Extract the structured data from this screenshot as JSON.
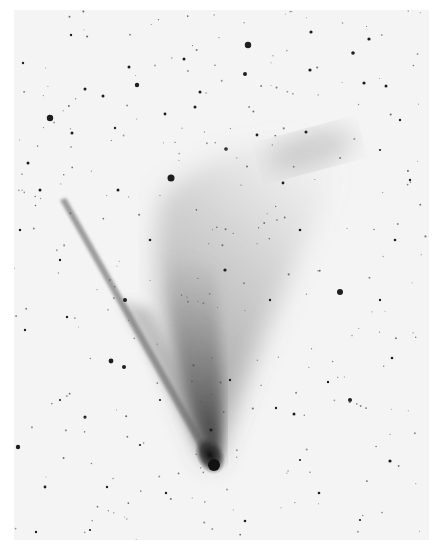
{
  "image": {
    "subject": "comet",
    "rendering": "negative photographic print (dark on light)",
    "colors": {
      "background": "#f4f4f4",
      "margin": "#ffffff",
      "nucleus": "#1a1a1a",
      "tail": "#6a6a6a",
      "stars": "#1e1e1e"
    },
    "nucleus": {
      "x": 202,
      "y": 457
    },
    "stars": [
      [
        248,
        45,
        3.2
      ],
      [
        50,
        118,
        3.2
      ],
      [
        171,
        178,
        3.5
      ],
      [
        340,
        292,
        3
      ],
      [
        125,
        300,
        2
      ],
      [
        184,
        59,
        1.5
      ],
      [
        245,
        74,
        2
      ],
      [
        129,
        67,
        1.5
      ],
      [
        137,
        85,
        2.2
      ],
      [
        103,
        96,
        1.5
      ],
      [
        200,
        92,
        1.5
      ],
      [
        311,
        32,
        1.6
      ],
      [
        369,
        39,
        1.6
      ],
      [
        353,
        53,
        1.8
      ],
      [
        364,
        83,
        1.6
      ],
      [
        386,
        86,
        1.5
      ],
      [
        310,
        70,
        1.6
      ],
      [
        306,
        132,
        1.5
      ],
      [
        257,
        135,
        1.4
      ],
      [
        283,
        183,
        1.4
      ],
      [
        226,
        149,
        1.8
      ],
      [
        195,
        107,
        1.5
      ],
      [
        165,
        114,
        1.4
      ],
      [
        118,
        190,
        1.5
      ],
      [
        72,
        133,
        1.5
      ],
      [
        28,
        163,
        1.5
      ],
      [
        40,
        190,
        1.5
      ],
      [
        23,
        63,
        1.2
      ],
      [
        71,
        35,
        1.2
      ],
      [
        85,
        89,
        1.5
      ],
      [
        115,
        128,
        1.2
      ],
      [
        350,
        400,
        2
      ],
      [
        294,
        414,
        1.5
      ],
      [
        211,
        430,
        1.6
      ],
      [
        111,
        361,
        2.4
      ],
      [
        85,
        417,
        1.6
      ],
      [
        124,
        367,
        2
      ],
      [
        18,
        447,
        2.2
      ],
      [
        45,
        487,
        1.4
      ],
      [
        390,
        461,
        1.6
      ],
      [
        319,
        493,
        1.3
      ],
      [
        392,
        358,
        1.3
      ],
      [
        328,
        382,
        1.2
      ],
      [
        276,
        408,
        1.2
      ],
      [
        166,
        493,
        1.2
      ],
      [
        107,
        487,
        1.2
      ],
      [
        245,
        521,
        1.3
      ],
      [
        36,
        532,
        1.2
      ],
      [
        25,
        330,
        1.2
      ],
      [
        67,
        317,
        1.2
      ],
      [
        395,
        240,
        1.3
      ],
      [
        380,
        300,
        1.2
      ],
      [
        300,
        230,
        1.3
      ],
      [
        225,
        270,
        1.6
      ],
      [
        270,
        300,
        1.2
      ],
      [
        150,
        240,
        1.3
      ],
      [
        60,
        260,
        1.2
      ],
      [
        20,
        230,
        1.2
      ],
      [
        410,
        180,
        1.2
      ],
      [
        400,
        120,
        1.2
      ],
      [
        160,
        400,
        1.1
      ],
      [
        230,
        380,
        1.2
      ],
      [
        300,
        460,
        1.1
      ],
      [
        360,
        520,
        1.1
      ],
      [
        90,
        530,
        1.1
      ],
      [
        140,
        445,
        1.1
      ],
      [
        60,
        400,
        1.1
      ],
      [
        380,
        150,
        1.1
      ]
    ]
  }
}
